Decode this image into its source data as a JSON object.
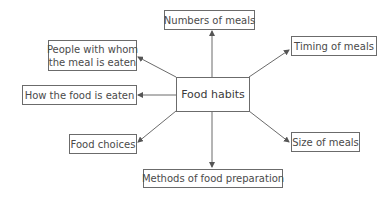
{
  "diagram": {
    "center": "Food habits",
    "nodes": {
      "top": "Numbers of meals",
      "top_right": "Timing of meals",
      "bottom_right": "Size of meals",
      "bottom": "Methods of food preparation",
      "bottom_left": "Food choices",
      "left": "How the food is eaten",
      "top_left_line1": "People with whom",
      "top_left_line2": "the meal is eaten"
    },
    "colors": {
      "line": "#6b6b6b",
      "text": "#4a4a4a",
      "background": "#ffffff"
    }
  }
}
